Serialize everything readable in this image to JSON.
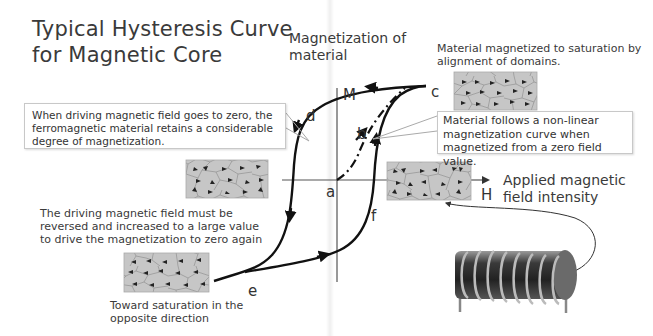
{
  "title": {
    "line1": "Typical Hysteresis Curve",
    "line2": "for Magnetic Core"
  },
  "axes": {
    "y_axis_label_line1": "Magnetization of",
    "y_axis_label_line2": "material",
    "y_axis_symbol": "M",
    "x_axis_label_line1": "Applied magnetic",
    "x_axis_label_line2": "field intensity",
    "x_axis_symbol": "H"
  },
  "curve_points": {
    "a": "a",
    "b": "b",
    "c": "c",
    "d": "d",
    "e": "e",
    "f": "f"
  },
  "annotations": {
    "saturation": {
      "line1": "Material magnetized to saturation by",
      "line2": "alignment of domains."
    },
    "retention_callout": {
      "line1": "When driving magnetic field goes to zero, the",
      "line2": "ferromagnetic material retains a considerable",
      "line3": "degree of magnetization."
    },
    "nonlinear_callout": {
      "line1": "Material follows a non-linear",
      "line2": "magnetization curve when",
      "line3": "magnetized from a zero field value."
    },
    "coercive": {
      "line1": "The driving magnetic field must be",
      "line2": "reversed and increased to a large value",
      "line3": "to drive the magnetization to zero again"
    },
    "reverse_saturation": {
      "line1": "Toward saturation in the",
      "line2": "opposite direction"
    }
  },
  "colors": {
    "curve": "#111111",
    "axis": "#555555",
    "domain_fill": "#c4c4c4",
    "text": "#3a3a3a"
  }
}
